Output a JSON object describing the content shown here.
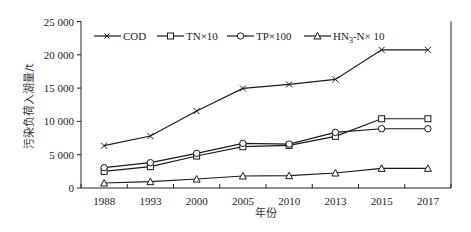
{
  "chart_data": {
    "type": "line",
    "title": "",
    "xlabel": "年份",
    "ylabel": "污染负荷入湖量/t",
    "categories": [
      "1988",
      "1993",
      "2000",
      "2005",
      "2010",
      "2013",
      "2015",
      "2017"
    ],
    "ylim": [
      0,
      25000
    ],
    "yticks": [
      0,
      5000,
      10000,
      15000,
      20000,
      25000
    ],
    "ytick_labels": [
      "0",
      "5 000",
      "10 000",
      "15 000",
      "20 000",
      "25 000"
    ],
    "grid": false,
    "legend_position": "top-left inside",
    "series": [
      {
        "name": "COD",
        "marker": "x",
        "values": [
          6350,
          7800,
          11550,
          14950,
          15550,
          16300,
          20750,
          20750
        ]
      },
      {
        "name": "TN×10",
        "marker": "square",
        "values": [
          2500,
          3200,
          4800,
          6200,
          6400,
          7750,
          10400,
          10400
        ]
      },
      {
        "name": "TP×100",
        "marker": "circle",
        "values": [
          3050,
          3800,
          5200,
          6700,
          6600,
          8350,
          8900,
          8900
        ]
      },
      {
        "name": "HN3-N× 10",
        "marker": "triangle",
        "values": [
          750,
          950,
          1350,
          1800,
          1850,
          2250,
          2950,
          2950
        ]
      }
    ]
  },
  "legend": {
    "items": [
      {
        "label": "COD",
        "icon": "x-marker-icon"
      },
      {
        "label": "TN×10",
        "icon": "square-marker-icon"
      },
      {
        "label": "TP×100",
        "icon": "circle-marker-icon"
      },
      {
        "label_main": "HN",
        "label_sub": "3",
        "label_rest": "-N× 10",
        "icon": "triangle-marker-icon"
      }
    ]
  },
  "colors": {
    "line": "#1a1a1a",
    "axis": "#222222",
    "background": "#ffffff"
  }
}
